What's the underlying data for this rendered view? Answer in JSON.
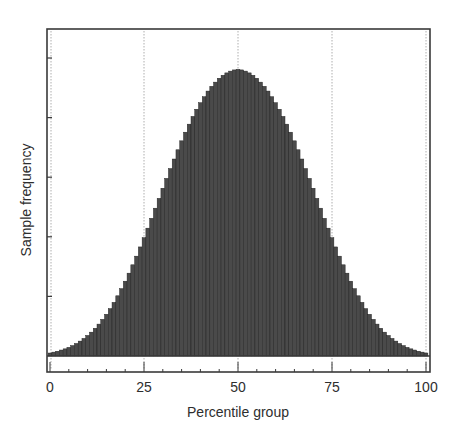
{
  "chart_data": {
    "type": "bar",
    "title": "",
    "xlabel": "Percentile group",
    "ylabel": "Sample frequency",
    "xlim": [
      0,
      100
    ],
    "ylim": [
      0,
      100
    ],
    "y_units": "relative frequency (peak = 100); axis unlabelled in source",
    "x_ticks": [
      0,
      25,
      50,
      75,
      100
    ],
    "x_tick_labels": [
      "0",
      "25",
      "50",
      "75",
      "100"
    ],
    "y_ticks": [
      20,
      40,
      60,
      80,
      100
    ],
    "y_tick_labels": [],
    "grid": {
      "vertical_at": [
        25,
        50,
        75,
        100
      ],
      "style": "dotted"
    },
    "legend": null,
    "distribution": {
      "shape": "normal",
      "mean": 50,
      "sd": 15.5
    },
    "categories": [
      0,
      1,
      2,
      3,
      4,
      5,
      6,
      7,
      8,
      9,
      10,
      11,
      12,
      13,
      14,
      15,
      16,
      17,
      18,
      19,
      20,
      21,
      22,
      23,
      24,
      25,
      26,
      27,
      28,
      29,
      30,
      31,
      32,
      33,
      34,
      35,
      36,
      37,
      38,
      39,
      40,
      41,
      42,
      43,
      44,
      45,
      46,
      47,
      48,
      49,
      50,
      51,
      52,
      53,
      54,
      55,
      56,
      57,
      58,
      59,
      60,
      61,
      62,
      63,
      64,
      65,
      66,
      67,
      68,
      69,
      70,
      71,
      72,
      73,
      74,
      75,
      76,
      77,
      78,
      79,
      80,
      81,
      82,
      83,
      84,
      85,
      86,
      87,
      88,
      89,
      90,
      91,
      92,
      93,
      94,
      95,
      96,
      97,
      98,
      99,
      100
    ],
    "values": [
      1.0,
      1.3,
      1.6,
      2.0,
      2.4,
      2.9,
      3.5,
      4.2,
      5.0,
      5.9,
      6.9,
      8.0,
      9.3,
      10.7,
      12.3,
      14.0,
      15.9,
      18.0,
      20.2,
      22.6,
      25.1,
      27.8,
      30.6,
      33.5,
      36.6,
      39.7,
      42.9,
      46.2,
      49.6,
      52.9,
      56.3,
      59.6,
      62.9,
      66.1,
      69.2,
      72.2,
      75.1,
      77.8,
      80.4,
      82.8,
      85.0,
      87.0,
      88.9,
      90.5,
      91.9,
      93.2,
      94.2,
      95.0,
      95.6,
      96.0,
      96.2,
      96.0,
      95.6,
      95.0,
      94.2,
      93.2,
      91.9,
      90.5,
      88.9,
      87.0,
      85.0,
      82.8,
      80.4,
      77.8,
      75.1,
      72.2,
      69.2,
      66.1,
      62.9,
      59.6,
      56.3,
      52.9,
      49.6,
      46.2,
      42.9,
      39.7,
      36.6,
      33.5,
      30.6,
      27.8,
      25.1,
      22.6,
      20.2,
      18.0,
      15.9,
      14.0,
      12.3,
      10.7,
      9.3,
      8.0,
      6.9,
      5.9,
      5.0,
      4.2,
      3.5,
      2.9,
      2.4,
      2.0,
      1.6,
      1.3,
      1.0
    ],
    "colors": {
      "bars": "#4a4a4a",
      "bar_edge": "#1e1e1e",
      "frame": "#3a3a3a",
      "grid": "#9a9a9a",
      "text": "#2e2e2e"
    }
  }
}
